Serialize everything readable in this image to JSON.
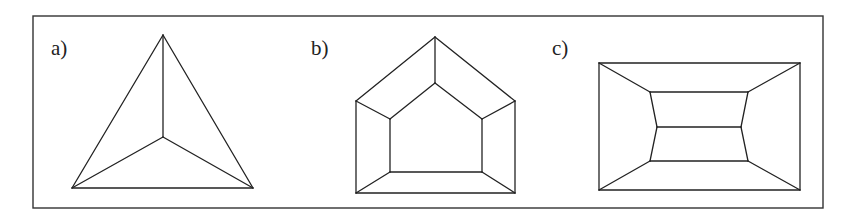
{
  "figure": {
    "frame": {
      "x": 33,
      "y": 16,
      "width": 790,
      "height": 192
    },
    "stroke_color": "#222222",
    "panels": [
      {
        "id": "a",
        "label": "a)",
        "label_pos": {
          "x": 51,
          "y": 38
        },
        "description": "Triangle with interior point connected to three vertices",
        "vertices": {
          "apex": [
            163,
            35
          ],
          "bottom_left": [
            72,
            188
          ],
          "bottom_right": [
            253,
            188
          ],
          "center": [
            163,
            137
          ]
        },
        "edges": [
          [
            "apex",
            "bottom_left"
          ],
          [
            "apex",
            "bottom_right"
          ],
          [
            "bottom_left",
            "bottom_right"
          ],
          [
            "apex",
            "center"
          ],
          [
            "bottom_left",
            "center"
          ],
          [
            "bottom_right",
            "center"
          ]
        ]
      },
      {
        "id": "b",
        "label": "b)",
        "label_pos": {
          "x": 311,
          "y": 38
        },
        "description": "Outer pentagon (house shape) with inner pentagon, corresponding vertices connected",
        "vertices": {
          "o_apex": [
            435,
            37
          ],
          "o_left": [
            356,
            101
          ],
          "o_right": [
            515,
            101
          ],
          "o_bl": [
            356,
            193
          ],
          "o_br": [
            515,
            193
          ],
          "i_apex": [
            435,
            83
          ],
          "i_left": [
            390,
            119
          ],
          "i_right": [
            482,
            119
          ],
          "i_bl": [
            390,
            172
          ],
          "i_br": [
            482,
            172
          ]
        },
        "edges": [
          [
            "o_apex",
            "o_left"
          ],
          [
            "o_apex",
            "o_right"
          ],
          [
            "o_left",
            "o_bl"
          ],
          [
            "o_right",
            "o_br"
          ],
          [
            "o_bl",
            "o_br"
          ],
          [
            "i_apex",
            "i_left"
          ],
          [
            "i_apex",
            "i_right"
          ],
          [
            "i_left",
            "i_bl"
          ],
          [
            "i_right",
            "i_br"
          ],
          [
            "i_bl",
            "i_br"
          ],
          [
            "o_apex",
            "i_apex"
          ],
          [
            "o_left",
            "i_left"
          ],
          [
            "o_right",
            "i_right"
          ],
          [
            "o_bl",
            "i_bl"
          ],
          [
            "o_br",
            "i_br"
          ]
        ]
      },
      {
        "id": "c",
        "label": "c)",
        "label_pos": {
          "x": 552,
          "y": 38
        },
        "description": "Outer rectangle with inner subdivided hexagon, corner vertices connected",
        "vertices": {
          "o_tl": [
            599,
            63
          ],
          "o_tr": [
            800,
            63
          ],
          "o_bl": [
            599,
            190
          ],
          "o_br": [
            800,
            190
          ],
          "i_tl": [
            650,
            92
          ],
          "i_tr": [
            748,
            92
          ],
          "m_l": [
            657,
            127
          ],
          "m_r": [
            741,
            127
          ],
          "i_bl": [
            650,
            161
          ],
          "i_br": [
            748,
            161
          ]
        },
        "edges": [
          [
            "o_tl",
            "o_tr"
          ],
          [
            "o_tr",
            "o_br"
          ],
          [
            "o_br",
            "o_bl"
          ],
          [
            "o_bl",
            "o_tl"
          ],
          [
            "i_tl",
            "i_tr"
          ],
          [
            "i_tr",
            "m_r"
          ],
          [
            "m_r",
            "i_br"
          ],
          [
            "i_br",
            "i_bl"
          ],
          [
            "i_bl",
            "m_l"
          ],
          [
            "m_l",
            "i_tl"
          ],
          [
            "m_l",
            "m_r"
          ],
          [
            "o_tl",
            "i_tl"
          ],
          [
            "o_tr",
            "i_tr"
          ],
          [
            "o_bl",
            "i_bl"
          ],
          [
            "o_br",
            "i_br"
          ]
        ]
      }
    ]
  }
}
